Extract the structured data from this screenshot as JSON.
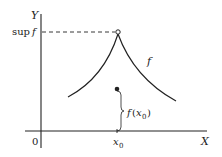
{
  "diagram": {
    "axes": {
      "y_label": "Y",
      "x_label": "X",
      "origin_label": "0"
    },
    "labels": {
      "sup": "sup",
      "sup_f": "f",
      "curve_label": "f",
      "point_label_f": "f",
      "point_label_open": "(",
      "point_label_x": "x",
      "point_label_sub": "0",
      "point_label_close": ")",
      "x0_label": "x",
      "x0_sub": "0"
    },
    "colors": {
      "line": "#222222",
      "background": "#ffffff"
    }
  }
}
